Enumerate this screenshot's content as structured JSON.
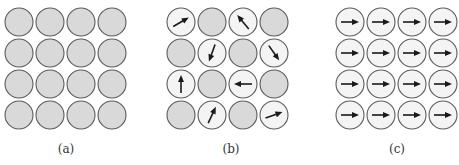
{
  "colors": {
    "gray_fill": "#d9d9d9",
    "white_fill": "#f4f4f4",
    "stroke": "#5a5a5a",
    "arrow": "#1a1a1a"
  },
  "grid": {
    "rows": 4,
    "cols": 4,
    "radius": 14,
    "pitch": 31,
    "origin_y": 22
  },
  "panels": [
    {
      "label": "(a)",
      "origin_x": 19,
      "label_x": 66,
      "description": "unmagnetized, no dipoles",
      "cells": [
        [
          null,
          null,
          null,
          null
        ],
        [
          null,
          null,
          null,
          null
        ],
        [
          null,
          null,
          null,
          null
        ],
        [
          null,
          null,
          null,
          null
        ]
      ]
    },
    {
      "label": "(b)",
      "origin_x": 181,
      "label_x": 231,
      "description": "randomly oriented dipoles",
      "cells": [
        [
          -30,
          null,
          -130,
          null
        ],
        [
          null,
          110,
          null,
          55
        ],
        [
          -90,
          null,
          180,
          null
        ],
        [
          null,
          -65,
          null,
          -20
        ]
      ]
    },
    {
      "label": "(c)",
      "origin_x": 350,
      "label_x": 397,
      "description": "aligned dipoles",
      "cells": [
        [
          0,
          0,
          0,
          0
        ],
        [
          0,
          0,
          0,
          0
        ],
        [
          0,
          0,
          0,
          0
        ],
        [
          0,
          0,
          0,
          0
        ]
      ]
    }
  ]
}
